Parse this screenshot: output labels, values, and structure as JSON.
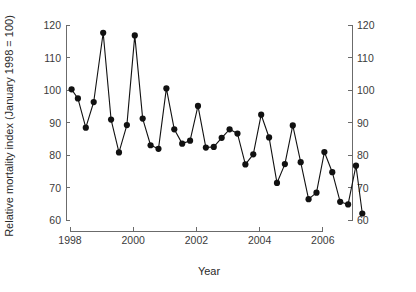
{
  "chart_data": {
    "type": "line",
    "title": "",
    "subtitle": "",
    "xlabel": "Year",
    "ylabel": "Relative mortality index (January 1998 = 100)",
    "ylabel_right": "Relative mortality index (January 1998 = 100)",
    "xlim": [
      1997.85,
      1998.0
    ],
    "ylim": [
      60,
      120
    ],
    "xticks": [
      1998,
      2000,
      2002,
      2004,
      2006
    ],
    "xtick_labels": [
      "1998",
      "2000",
      "2002",
      "2004",
      "2006"
    ],
    "yticks": [
      60,
      70,
      80,
      90,
      100,
      110,
      120
    ],
    "ytick_labels": [
      "60",
      "70",
      "80",
      "90",
      "100",
      "110",
      "120"
    ],
    "yticks_right": [
      60,
      70,
      80,
      90,
      100,
      110,
      120
    ],
    "ytick_labels_right": [
      "60",
      "70",
      "80",
      "90",
      "100",
      "110",
      "120"
    ],
    "grid": false,
    "legend": null,
    "legend_position": "none",
    "marker": "filled-circle",
    "line_color": "#111111",
    "marker_color": "#111111",
    "axis_color": "#6b6b6b",
    "background_color": "#ffffff",
    "x_axis_range_drawn": [
      1998,
      2006.6
    ],
    "y_axis_range_drawn": [
      60,
      120
    ],
    "series": [
      {
        "name": "Relative mortality index",
        "x": [
          1998.05,
          1998.25,
          1998.5,
          1998.75,
          1999.05,
          1999.3,
          1999.55,
          1999.8,
          2000.05,
          2000.3,
          2000.55,
          2000.8,
          2001.05,
          2001.3,
          2001.55,
          2001.8,
          2002.05,
          2002.3,
          2002.55,
          2002.8,
          2003.05,
          2003.3,
          2003.55,
          2003.8,
          2004.05,
          2004.3,
          2004.55,
          2004.8,
          2005.05,
          2005.3,
          2005.55,
          2005.8,
          2006.05,
          2006.3,
          2006.55,
          2006.8,
          2007.05,
          2007.25
        ],
        "values": [
          100.2,
          97.4,
          88.4,
          96.3,
          117.6,
          90.9,
          80.8,
          89.2,
          116.8,
          91.2,
          83.0,
          81.9,
          100.5,
          87.9,
          83.5,
          84.4,
          95.1,
          82.3,
          82.5,
          85.3,
          87.9,
          86.6,
          77.1,
          80.2,
          92.4,
          85.4,
          71.4,
          77.2,
          89.1,
          77.8,
          66.4,
          68.4,
          80.9,
          74.7,
          65.6,
          64.8,
          76.7,
          62.0
        ]
      }
    ],
    "notes": {
      "peak_1": 117.6,
      "peak_2": 116.8,
      "first_value": 100.2,
      "last_value": 62.0,
      "trend": "declining seasonal oscillation"
    }
  },
  "figure": {
    "x_axis_title": "Year",
    "y_axis_title": "Relative mortality index (January 1998 = 100)"
  }
}
